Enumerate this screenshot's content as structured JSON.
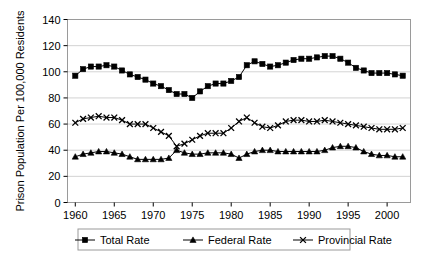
{
  "chart_data": {
    "type": "line",
    "title": "",
    "xlabel": "",
    "ylabel": "Prison Population Per 100,000 Residents",
    "xlim": [
      1959,
      2003
    ],
    "ylim": [
      0,
      140
    ],
    "ytick_step": 20,
    "yticks": [
      0,
      20,
      40,
      60,
      80,
      100,
      120,
      140
    ],
    "xticks": [
      1960,
      1965,
      1970,
      1975,
      1980,
      1985,
      1990,
      1995,
      2000
    ],
    "xtick_labels": [
      "1960",
      "1965",
      "1970",
      "1975",
      "1980",
      "1985",
      "1990",
      "1995",
      "2000"
    ],
    "ytick_labels": [
      "0",
      "20",
      "40",
      "60",
      "80",
      "100",
      "120",
      "140"
    ],
    "grid": "horizontal",
    "legend_position": "bottom",
    "x": [
      1960,
      1961,
      1962,
      1963,
      1964,
      1965,
      1966,
      1967,
      1968,
      1969,
      1970,
      1971,
      1972,
      1973,
      1974,
      1975,
      1976,
      1977,
      1978,
      1979,
      1980,
      1981,
      1982,
      1983,
      1984,
      1985,
      1986,
      1987,
      1988,
      1989,
      1990,
      1991,
      1992,
      1993,
      1994,
      1995,
      1996,
      1997,
      1998,
      1999,
      2000,
      2001,
      2002
    ],
    "series": [
      {
        "name": "Total Rate",
        "marker": "square",
        "color": "#000000",
        "values": [
          97,
          102,
          104,
          104,
          105,
          104,
          101,
          98,
          96,
          94,
          91,
          89,
          86,
          83,
          83,
          80,
          85,
          89,
          91,
          91,
          93,
          96,
          105,
          108,
          106,
          104,
          105,
          107,
          109,
          110,
          110,
          111,
          112,
          112,
          110,
          107,
          103,
          101,
          99,
          99,
          99,
          98,
          97
        ]
      },
      {
        "name": "Federal Rate",
        "marker": "triangle",
        "color": "#000000",
        "values": [
          35,
          37,
          38,
          39,
          39,
          38,
          37,
          35,
          33,
          33,
          33,
          33,
          34,
          40,
          38,
          37,
          37,
          38,
          38,
          38,
          37,
          34,
          37,
          39,
          40,
          40,
          39,
          39,
          39,
          39,
          39,
          39,
          40,
          42,
          43,
          43,
          42,
          39,
          37,
          36,
          36,
          35,
          35
        ]
      },
      {
        "name": "Provincial Rate",
        "marker": "x",
        "color": "#000000",
        "values": [
          61,
          64,
          65,
          66,
          65,
          65,
          63,
          60,
          60,
          60,
          57,
          54,
          51,
          43,
          45,
          48,
          51,
          53,
          53,
          53,
          57,
          62,
          65,
          61,
          58,
          57,
          59,
          62,
          63,
          63,
          62,
          62,
          63,
          62,
          61,
          60,
          59,
          58,
          57,
          56,
          56,
          56,
          57
        ]
      }
    ]
  },
  "legend": {
    "items": [
      {
        "label": "Total Rate",
        "marker": "square"
      },
      {
        "label": "Federal Rate",
        "marker": "triangle"
      },
      {
        "label": "Provincial Rate",
        "marker": "x"
      }
    ]
  }
}
